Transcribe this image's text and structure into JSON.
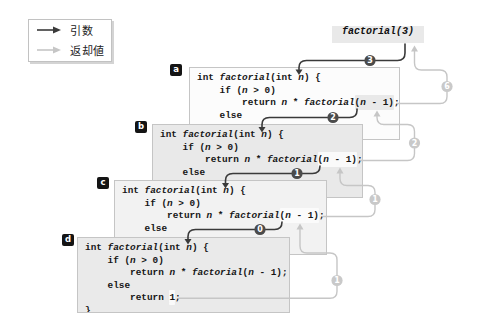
{
  "legend": {
    "argument_label": "引数",
    "return_label": "返却値"
  },
  "call_expression": "factorial(3)",
  "boxes": [
    {
      "label": "a",
      "variant": "call"
    },
    {
      "label": "b",
      "variant": "call"
    },
    {
      "label": "c",
      "variant": "call"
    },
    {
      "label": "d",
      "variant": "base"
    }
  ],
  "code": {
    "l1_int": "int ",
    "l1_fn": "factorial",
    "l1_open": "(int ",
    "l1_n": "n",
    "l1_close": ") {",
    "l2_if": "    if (",
    "l2_n": "n",
    "l2_cond": " > 0)",
    "l3_return": "        return ",
    "l3_n": "n",
    "l3_times": " * ",
    "l3_fn": "factorial",
    "l3_open": "(",
    "l3_arg_n": "n",
    "l3_rest": " - 1)",
    "l3_semi": ";",
    "l4_else": "    else",
    "l5_return": "        return ",
    "l5_one": "1",
    "l5_semi": ";",
    "l6_brace": "}"
  },
  "badges": {
    "args": [
      "3",
      "2",
      "1",
      "0"
    ],
    "returns": [
      "6",
      "2",
      "1",
      "1"
    ]
  }
}
